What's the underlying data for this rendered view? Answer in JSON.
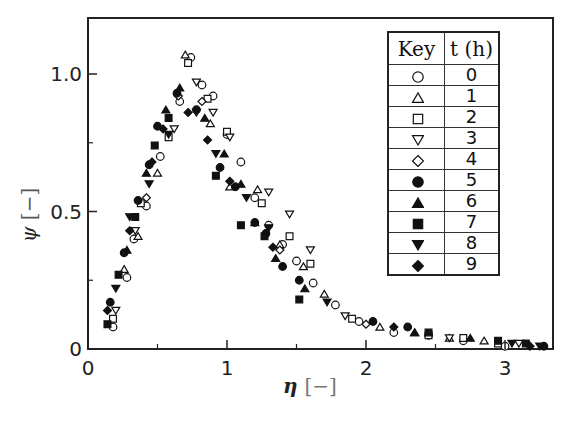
{
  "chart_data": {
    "type": "scatter",
    "title": "",
    "xlabel": "η [−]",
    "ylabel": "ψ [−]",
    "xlim": [
      0,
      3.3
    ],
    "ylim": [
      0,
      1.2
    ],
    "x_ticks": [
      0,
      1,
      2,
      3
    ],
    "x_minor_ticks": [
      0.5,
      1.5,
      2.5
    ],
    "y_ticks": [
      0,
      0.5,
      1.0
    ],
    "y_tick_labels": [
      "0",
      "0.5",
      "1.0"
    ],
    "y_minor_ticks": [
      0.25,
      0.75
    ],
    "grid": false,
    "legend_position": "upper right (table)",
    "legend_header": [
      "Key",
      "t (h)"
    ],
    "series": [
      {
        "name": "0",
        "marker": "circle-open",
        "points": [
          [
            0.18,
            0.08
          ],
          [
            0.28,
            0.26
          ],
          [
            0.33,
            0.4
          ],
          [
            0.42,
            0.52
          ],
          [
            0.52,
            0.7
          ],
          [
            0.66,
            0.9
          ],
          [
            0.74,
            1.06
          ],
          [
            0.82,
            0.96
          ],
          [
            0.9,
            0.92
          ],
          [
            1.0,
            0.78
          ],
          [
            1.1,
            0.68
          ],
          [
            1.2,
            0.55
          ],
          [
            1.3,
            0.45
          ],
          [
            1.4,
            0.38
          ],
          [
            1.5,
            0.32
          ],
          [
            1.62,
            0.24
          ],
          [
            1.78,
            0.16
          ],
          [
            1.95,
            0.1
          ],
          [
            2.2,
            0.06
          ],
          [
            2.45,
            0.05
          ],
          [
            2.7,
            0.03
          ],
          [
            3.0,
            0.01
          ]
        ]
      },
      {
        "name": "1",
        "marker": "triangle-open",
        "points": [
          [
            0.26,
            0.29
          ],
          [
            0.36,
            0.41
          ],
          [
            0.5,
            0.64
          ],
          [
            0.7,
            1.07
          ],
          [
            0.88,
            0.82
          ],
          [
            1.02,
            0.59
          ],
          [
            1.22,
            0.58
          ],
          [
            1.38,
            0.38
          ],
          [
            1.55,
            0.3
          ],
          [
            1.7,
            0.2
          ],
          [
            2.1,
            0.08
          ],
          [
            2.35,
            0.06
          ],
          [
            2.6,
            0.04
          ],
          [
            2.85,
            0.03
          ]
        ]
      },
      {
        "name": "2",
        "marker": "square-open",
        "points": [
          [
            0.18,
            0.11
          ],
          [
            0.38,
            0.53
          ],
          [
            0.58,
            0.77
          ],
          [
            0.72,
            1.04
          ],
          [
            0.86,
            0.91
          ],
          [
            1.0,
            0.79
          ],
          [
            1.25,
            0.53
          ],
          [
            1.45,
            0.41
          ],
          [
            1.6,
            0.31
          ],
          [
            1.9,
            0.11
          ],
          [
            2.45,
            0.05
          ],
          [
            2.7,
            0.04
          ],
          [
            2.95,
            0.02
          ]
        ]
      },
      {
        "name": "3",
        "marker": "triangle-down-open",
        "points": [
          [
            0.2,
            0.14
          ],
          [
            0.34,
            0.43
          ],
          [
            0.62,
            0.8
          ],
          [
            0.78,
            0.97
          ],
          [
            0.9,
            0.86
          ],
          [
            1.02,
            0.77
          ],
          [
            1.3,
            0.57
          ],
          [
            1.45,
            0.49
          ],
          [
            1.6,
            0.36
          ],
          [
            1.85,
            0.12
          ],
          [
            2.6,
            0.04
          ],
          [
            3.1,
            0.02
          ]
        ]
      },
      {
        "name": "4",
        "marker": "diamond-open",
        "points": [
          [
            0.42,
            0.55
          ],
          [
            0.65,
            0.92
          ],
          [
            0.82,
            0.9
          ],
          [
            1.38,
            0.36
          ],
          [
            2.0,
            0.09
          ]
        ]
      },
      {
        "name": "5",
        "marker": "circle-filled",
        "points": [
          [
            0.16,
            0.17
          ],
          [
            0.26,
            0.35
          ],
          [
            0.36,
            0.54
          ],
          [
            0.44,
            0.67
          ],
          [
            0.5,
            0.81
          ],
          [
            0.64,
            0.93
          ],
          [
            0.78,
            0.87
          ],
          [
            0.95,
            0.66
          ],
          [
            1.06,
            0.59
          ],
          [
            1.2,
            0.46
          ],
          [
            1.28,
            0.42
          ],
          [
            1.4,
            0.3
          ],
          [
            1.52,
            0.25
          ],
          [
            2.05,
            0.1
          ],
          [
            2.3,
            0.08
          ],
          [
            3.28,
            0.01
          ]
        ]
      },
      {
        "name": "6",
        "marker": "triangle-filled",
        "points": [
          [
            0.28,
            0.36
          ],
          [
            0.42,
            0.64
          ],
          [
            0.56,
            0.87
          ],
          [
            0.66,
            0.95
          ],
          [
            0.84,
            0.84
          ],
          [
            0.98,
            0.71
          ],
          [
            1.1,
            0.6
          ],
          [
            1.2,
            0.46
          ],
          [
            1.35,
            0.33
          ],
          [
            1.56,
            0.22
          ],
          [
            2.35,
            0.06
          ],
          [
            2.75,
            0.04
          ]
        ]
      },
      {
        "name": "7",
        "marker": "square-filled",
        "points": [
          [
            0.14,
            0.09
          ],
          [
            0.22,
            0.27
          ],
          [
            0.34,
            0.48
          ],
          [
            0.48,
            0.74
          ],
          [
            0.58,
            0.84
          ],
          [
            0.92,
            0.63
          ],
          [
            1.1,
            0.45
          ],
          [
            1.27,
            0.41
          ],
          [
            1.52,
            0.18
          ],
          [
            2.45,
            0.06
          ],
          [
            2.95,
            0.03
          ],
          [
            3.15,
            0.02
          ]
        ]
      },
      {
        "name": "8",
        "marker": "triangle-down-filled",
        "points": [
          [
            0.2,
            0.22
          ],
          [
            0.3,
            0.48
          ],
          [
            0.44,
            0.6
          ],
          [
            0.58,
            0.78
          ],
          [
            0.78,
            0.86
          ],
          [
            0.92,
            0.71
          ],
          [
            1.14,
            0.55
          ],
          [
            1.3,
            0.44
          ],
          [
            1.72,
            0.17
          ],
          [
            3.05,
            0.02
          ],
          [
            3.25,
            0.01
          ]
        ]
      },
      {
        "name": "9",
        "marker": "diamond-filled",
        "points": [
          [
            0.14,
            0.14
          ],
          [
            0.3,
            0.43
          ],
          [
            0.46,
            0.68
          ],
          [
            0.54,
            0.8
          ],
          [
            0.72,
            0.86
          ],
          [
            0.86,
            0.76
          ],
          [
            1.02,
            0.61
          ],
          [
            1.33,
            0.37
          ],
          [
            2.2,
            0.08
          ],
          [
            3.18,
            0.01
          ]
        ]
      }
    ]
  },
  "legend": {
    "header_key": "Key",
    "header_t": "t (h)",
    "rows": [
      {
        "marker": "circle-open",
        "t": "0"
      },
      {
        "marker": "triangle-open",
        "t": "1"
      },
      {
        "marker": "square-open",
        "t": "2"
      },
      {
        "marker": "triangle-down-open",
        "t": "3"
      },
      {
        "marker": "diamond-open",
        "t": "4"
      },
      {
        "marker": "circle-filled",
        "t": "5"
      },
      {
        "marker": "triangle-filled",
        "t": "6"
      },
      {
        "marker": "square-filled",
        "t": "7"
      },
      {
        "marker": "triangle-down-filled",
        "t": "8"
      },
      {
        "marker": "diamond-filled",
        "t": "9"
      }
    ]
  },
  "axes": {
    "x_title_symbol": "η",
    "x_title_unit": "[−]",
    "y_title_symbol": "ψ",
    "y_title_unit": "[−]"
  }
}
